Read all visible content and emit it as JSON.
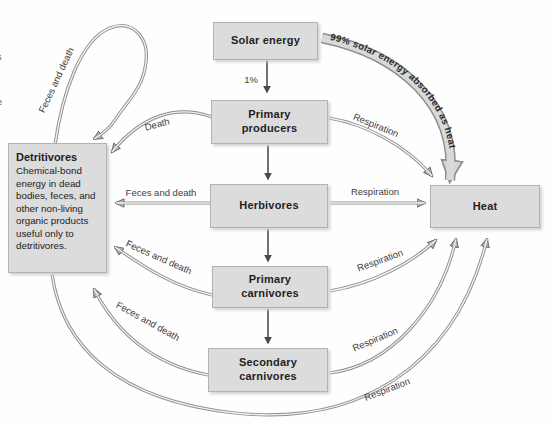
{
  "diagram": {
    "title_hint": "Energy flow through trophic levels",
    "boxes": {
      "solar_energy": "Solar energy",
      "primary_producers": "Primary\nproducers",
      "herbivores": "Herbivores",
      "primary_carnivores": "Primary\ncarnivores",
      "secondary_carnivores": "Secondary\ncarnivores",
      "heat": "Heat",
      "detritivores_title": "Detritivores",
      "detritivores_body": "Chemical-bond energy in dead bodies, feces, and other non-living organic products useful only to detritivores."
    },
    "labels": {
      "one_percent": "1%",
      "ninety_nine_percent": "99% solar energy absorbed as heat",
      "death": "Death",
      "feces_and_death": "Feces and death",
      "respiration": "Respiration"
    },
    "edges": [
      {
        "from": "Solar energy",
        "to": "Primary producers",
        "label": "1%"
      },
      {
        "from": "Solar energy",
        "to": "Heat",
        "label": "99% solar energy absorbed as heat"
      },
      {
        "from": "Primary producers",
        "to": "Herbivores",
        "label": ""
      },
      {
        "from": "Primary producers",
        "to": "Detritivores",
        "label": "Death"
      },
      {
        "from": "Primary producers",
        "to": "Heat",
        "label": "Respiration"
      },
      {
        "from": "Herbivores",
        "to": "Primary carnivores",
        "label": ""
      },
      {
        "from": "Herbivores",
        "to": "Detritivores",
        "label": "Feces and death"
      },
      {
        "from": "Herbivores",
        "to": "Heat",
        "label": "Respiration"
      },
      {
        "from": "Primary carnivores",
        "to": "Secondary carnivores",
        "label": ""
      },
      {
        "from": "Primary carnivores",
        "to": "Detritivores",
        "label": "Feces and death"
      },
      {
        "from": "Primary carnivores",
        "to": "Heat",
        "label": "Respiration"
      },
      {
        "from": "Secondary carnivores",
        "to": "Detritivores",
        "label": "Feces and death"
      },
      {
        "from": "Secondary carnivores",
        "to": "Heat",
        "label": "Respiration"
      },
      {
        "from": "Detritivores",
        "to": "Detritivores",
        "label": "Feces and death"
      },
      {
        "from": "Detritivores",
        "to": "Heat",
        "label": "Respiration"
      }
    ],
    "edge_fragments": {
      "frag1": "s",
      "frag2": "e"
    },
    "colors": {
      "box_fill": "#dcdcdc",
      "box_border": "#b2b2b2",
      "arrow_gray": "#8c8c8c",
      "arrow_dark": "#4d4d4d",
      "band_fill": "#d9d9d9",
      "text": "#1f1f1f"
    }
  }
}
